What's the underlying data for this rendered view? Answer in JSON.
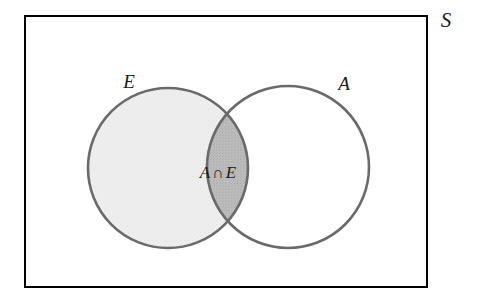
{
  "figure": {
    "type": "venn-diagram",
    "width": 478,
    "height": 307,
    "background_color": "#ffffff"
  },
  "universe": {
    "name": "universal-set",
    "label": "S",
    "shape": "rectangle",
    "border_color": "#000000",
    "border_width": 2,
    "fill_color": "#ffffff",
    "x": 25,
    "y": 16,
    "width": 402,
    "height": 271,
    "label_x": 446,
    "label_y": 27
  },
  "sets": [
    {
      "name": "set-e",
      "label": "E",
      "cx": 168,
      "cy": 168,
      "r": 80,
      "stroke_color": "#6a6a6a",
      "stroke_width": 2.6,
      "fill_color": "#ececec",
      "shaded": true,
      "label_x": 129,
      "label_y": 88
    },
    {
      "name": "set-a",
      "label": "A",
      "cx": 288,
      "cy": 167,
      "r": 81,
      "stroke_color": "#6a6a6a",
      "stroke_width": 2.6,
      "fill_color": "none",
      "shaded": false,
      "label_x": 344,
      "label_y": 90
    }
  ],
  "intersection": {
    "name": "intersection-region",
    "label_left": "A",
    "operator": "∩",
    "label_right": "E",
    "full_label": "A ∩ E",
    "fill_color": "#b8b8b8",
    "label_x": 218,
    "label_y": 178
  },
  "colors": {
    "border": "#000000",
    "circle_stroke": "#6a6a6a",
    "shaded_set_fill": "#ececec",
    "intersection_fill": "#b8b8b8",
    "text": "#1a1a1a",
    "background": "#ffffff"
  }
}
